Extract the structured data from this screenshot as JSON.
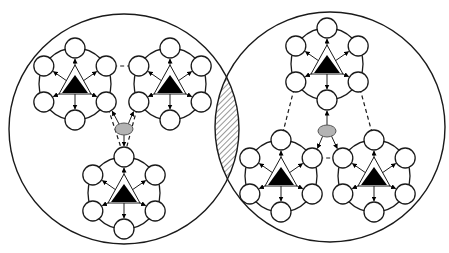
{
  "diagram": {
    "title": "",
    "colors": {
      "stroke": "#1a1a1a",
      "node_fill": "#ffffff",
      "triangle_fill": "#000000",
      "ellipse_fill": "#b3b3b3",
      "hatch": "#333333",
      "background": "#ffffff"
    },
    "domains": [
      {
        "id": "left",
        "cx": 124,
        "cy": 129,
        "r": 115,
        "hub": {
          "cx": 124,
          "cy": 129,
          "rx": 9,
          "ry": 6
        },
        "clusters": [
          {
            "id": "L1",
            "cx": 75,
            "cy": 84
          },
          {
            "id": "L2",
            "cx": 170,
            "cy": 84
          },
          {
            "id": "L3",
            "cx": 124,
            "cy": 193
          }
        ]
      },
      {
        "id": "right",
        "cx": 330,
        "cy": 127,
        "r": 115,
        "hub": {
          "cx": 327,
          "cy": 131,
          "rx": 9,
          "ry": 6
        },
        "clusters": [
          {
            "id": "R1",
            "cx": 327,
            "cy": 64
          },
          {
            "id": "R2",
            "cx": 281,
            "cy": 176
          },
          {
            "id": "R3",
            "cx": 374,
            "cy": 176
          }
        ]
      }
    ],
    "overlap": {
      "pattern": "diagonal-hatch"
    },
    "cluster_shape": {
      "nodes_per_cluster": 6,
      "ring_radius": 36,
      "node_radius": 10,
      "center_shape": "triangle"
    }
  }
}
